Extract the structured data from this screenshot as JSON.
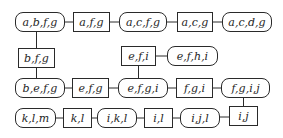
{
  "diagram": {
    "type": "junction-tree",
    "colors": {
      "stroke": "#2a2a2a",
      "text": "#1e1e1e",
      "background": "#ffffff"
    },
    "nodes": [
      {
        "id": "n1",
        "label": "a,b,f,g",
        "kind": "clique",
        "x": 15,
        "y": 12,
        "w": 50
      },
      {
        "id": "n2",
        "label": "a,f,g",
        "kind": "separator",
        "x": 73,
        "y": 12,
        "w": 37
      },
      {
        "id": "n3",
        "label": "a,c,f,g",
        "kind": "clique",
        "x": 119,
        "y": 12,
        "w": 48
      },
      {
        "id": "n4",
        "label": "a,c,g",
        "kind": "separator",
        "x": 177,
        "y": 12,
        "w": 36
      },
      {
        "id": "n5",
        "label": "a,c,d,g",
        "kind": "clique",
        "x": 222,
        "y": 12,
        "w": 50
      },
      {
        "id": "n6",
        "label": "b,f,g",
        "kind": "separator",
        "x": 18,
        "y": 48,
        "w": 37
      },
      {
        "id": "n7",
        "label": "e,f,i",
        "kind": "separator",
        "x": 121,
        "y": 46,
        "w": 35
      },
      {
        "id": "n8",
        "label": "e,f,h,i",
        "kind": "clique",
        "x": 167,
        "y": 46,
        "w": 51
      },
      {
        "id": "n9",
        "label": "b,e,f,g",
        "kind": "clique",
        "x": 15,
        "y": 78,
        "w": 50
      },
      {
        "id": "n10",
        "label": "e,f,g",
        "kind": "separator",
        "x": 72,
        "y": 78,
        "w": 37
      },
      {
        "id": "n11",
        "label": "e,f,g,i",
        "kind": "clique",
        "x": 118,
        "y": 78,
        "w": 50
      },
      {
        "id": "n12",
        "label": "f,g,i",
        "kind": "separator",
        "x": 176,
        "y": 78,
        "w": 37
      },
      {
        "id": "n13",
        "label": "f,g,i,j",
        "kind": "clique",
        "x": 221,
        "y": 78,
        "w": 49
      },
      {
        "id": "n14",
        "label": "k,l,m",
        "kind": "clique",
        "x": 15,
        "y": 108,
        "w": 41
      },
      {
        "id": "n15",
        "label": "k,l",
        "kind": "separator",
        "x": 63,
        "y": 108,
        "w": 29
      },
      {
        "id": "n16",
        "label": "i,k,l",
        "kind": "clique",
        "x": 97,
        "y": 108,
        "w": 40
      },
      {
        "id": "n17",
        "label": "i,l",
        "kind": "separator",
        "x": 144,
        "y": 108,
        "w": 29
      },
      {
        "id": "n18",
        "label": "i,j,l",
        "kind": "clique",
        "x": 180,
        "y": 108,
        "w": 40
      },
      {
        "id": "n19",
        "label": "i,j",
        "kind": "separator",
        "x": 229,
        "y": 106,
        "w": 29
      }
    ],
    "edges": [
      [
        "n1",
        "n2"
      ],
      [
        "n2",
        "n3"
      ],
      [
        "n3",
        "n4"
      ],
      [
        "n4",
        "n5"
      ],
      [
        "n1",
        "n6"
      ],
      [
        "n6",
        "n9"
      ],
      [
        "n7",
        "n8"
      ],
      [
        "n7",
        "n11"
      ],
      [
        "n9",
        "n10"
      ],
      [
        "n10",
        "n11"
      ],
      [
        "n11",
        "n12"
      ],
      [
        "n12",
        "n13"
      ],
      [
        "n13",
        "n19"
      ],
      [
        "n14",
        "n15"
      ],
      [
        "n15",
        "n16"
      ],
      [
        "n16",
        "n17"
      ],
      [
        "n17",
        "n18"
      ],
      [
        "n18",
        "n19"
      ]
    ]
  }
}
